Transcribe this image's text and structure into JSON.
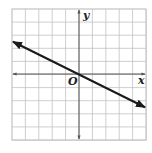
{
  "diagram": {
    "type": "coordinate-plane",
    "axis_labels": {
      "x": "x",
      "y": "y",
      "origin": "O"
    },
    "grid": {
      "x_min": -5,
      "x_max": 5,
      "y_min": -5,
      "y_max": 5,
      "step": 1
    },
    "colors": {
      "grid": "#b5b5b5",
      "axis": "#555555",
      "line": "#1a1a1a",
      "background": "#ffffff"
    },
    "line": {
      "equation": "y = -1/2 x",
      "slope": -0.5,
      "y_intercept": 0,
      "from": [
        -5,
        2.5
      ],
      "to": [
        5,
        -2.5
      ],
      "arrows": "both"
    }
  }
}
